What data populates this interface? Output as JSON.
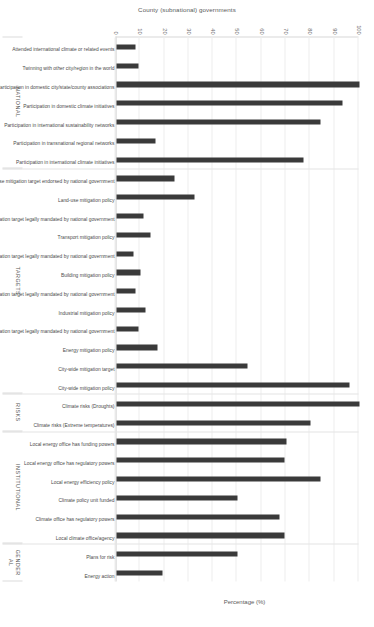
{
  "figure": {
    "y_axis_title": "County (subnational) governments",
    "x_axis_title": "Percentage (%)"
  },
  "chart_data": {
    "type": "bar",
    "title": "",
    "subtitle": "",
    "xlabel": "County (subnational) governments",
    "ylabel": "Percentage (%)",
    "ylim": [
      0,
      100
    ],
    "grid": true,
    "legend": "none",
    "orientation": "vertical-rotated",
    "bar_color": "#3a3a3a",
    "tick_labels": [
      "0",
      "10",
      "20",
      "30",
      "40",
      "50",
      "60",
      "70",
      "80",
      "90",
      "100"
    ],
    "groups": [
      {
        "name": "NATIONAL",
        "categories": [
          "Attended international climate or related events",
          "Twinning with other city/region in the world",
          "Participation in domestic city/state/county associations",
          "Participation in domestic climate initiatives",
          "Participation in international sustainability networks",
          "Participation in transnational regional networks",
          "Participation in international climate initiatives"
        ],
        "values": [
          8,
          9,
          100,
          93,
          84,
          16,
          77
        ]
      },
      {
        "name": "TARGETS",
        "categories": [
          "Landuse mitigation target endorsed by national government",
          "Land-use mitigation policy",
          "Transport mitigation target legally mandated by national government",
          "Transport mitigation policy",
          "Building mitigation target legally mandated by national government",
          "Building mitigation policy",
          "Industrial mitigation target legally mandated by national government",
          "Industrial mitigation policy",
          "Energy mitigation target legally mandated by national government",
          "Energy mitigation policy",
          "City-wide mitigation target",
          "City-wide mitigation policy"
        ],
        "values": [
          24,
          32,
          11,
          14,
          7,
          10,
          8,
          12,
          9,
          17,
          54,
          96
        ]
      },
      {
        "name": "RISKS",
        "categories": [
          "Climate risks (Droughts)",
          "Climate risks (Extreme temperatures)"
        ],
        "values": [
          100,
          80
        ]
      },
      {
        "name": "INSTITUTIONAL",
        "categories": [
          "Local energy office has funding powers",
          "Local energy office has regulatory powers",
          "Local energy efficiency policy",
          "Climate policy unit funded",
          "Climate office has regulatory powers",
          "Local climate office/agency"
        ],
        "values": [
          70,
          69,
          84,
          50,
          67,
          69
        ]
      },
      {
        "name": "GENDER\nAL",
        "categories": [
          "Plans for risk",
          "Energy action"
        ],
        "values": [
          50,
          19
        ]
      }
    ]
  }
}
